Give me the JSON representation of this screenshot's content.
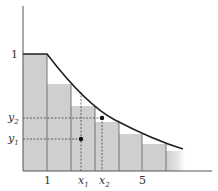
{
  "diagram": {
    "type": "riemann-sum-lower-bars-under-decreasing-curve",
    "colors": {
      "bar_fill": "#cfcfcf",
      "bar_stroke": "#555555",
      "curve": "#222222",
      "axis": "#555555",
      "guide": "#444444",
      "point": "#111111"
    },
    "axes": {
      "y_tick_labels": [
        {
          "text": "1",
          "y": 54
        }
      ],
      "x_tick_labels": [
        {
          "text": "1",
          "x": 47
        },
        {
          "text": "5",
          "x": 142
        }
      ]
    },
    "bars": [
      {
        "x0": 23,
        "x1": 47,
        "top": 54
      },
      {
        "x0": 47,
        "x1": 71,
        "top": 84
      },
      {
        "x0": 71,
        "x1": 95,
        "top": 106
      },
      {
        "x0": 95,
        "x1": 119,
        "top": 122
      },
      {
        "x0": 119,
        "x1": 142,
        "top": 134
      },
      {
        "x0": 142,
        "x1": 166,
        "top": 144
      },
      {
        "x0": 166,
        "x1": 184,
        "top": 151,
        "fading": true
      }
    ],
    "points": [
      {
        "name": "point-1",
        "x": 81,
        "y": 139,
        "x_label": "x",
        "x_sub": "1",
        "y_label": "y",
        "y_sub": "1"
      },
      {
        "name": "point-2",
        "x": 102,
        "y": 118,
        "x_label": "x",
        "x_sub": "2",
        "y_label": "y",
        "y_sub": "2"
      }
    ],
    "labels": {
      "y_one": "1",
      "x_one": "1",
      "x_five": "5",
      "x1_main": "x",
      "x1_sub": "1",
      "x2_main": "x",
      "x2_sub": "2",
      "y1_main": "y",
      "y1_sub": "1",
      "y2_main": "y",
      "y2_sub": "2"
    }
  }
}
